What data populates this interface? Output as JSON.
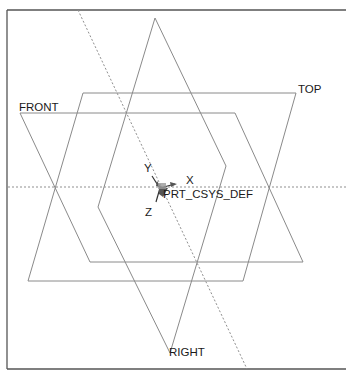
{
  "viewport": {
    "background": "#ffffff",
    "border_color": "#555555",
    "plane_color": "#8a8a8a"
  },
  "datum_planes": [
    {
      "name": "FRONT",
      "label": "FRONT",
      "points": "20,113 235,113 303,262 90,262",
      "label_x": 19,
      "label_y": 111
    },
    {
      "name": "TOP",
      "label": "TOP",
      "points": "83,93 296,93 243,281 28,281",
      "label_x": 298,
      "label_y": 93
    },
    {
      "name": "RIGHT",
      "label": "RIGHT",
      "points": "155,18 226,166 170,353 98,207",
      "label_x": 169,
      "label_y": 356
    }
  ],
  "datum_axes": [
    {
      "name": "horizontal-axis",
      "x1": 8,
      "y1": 187,
      "x2": 346,
      "y2": 187
    },
    {
      "name": "diagonal-axis",
      "x1": 78,
      "y1": 10,
      "x2": 247,
      "y2": 369
    }
  ],
  "coordinate_system": {
    "name": "PRT_CSYS_DEF",
    "label": "PRT_CSYS_DEF",
    "axis_x_label": "X",
    "axis_y_label": "Y",
    "axis_z_label": "Z"
  }
}
